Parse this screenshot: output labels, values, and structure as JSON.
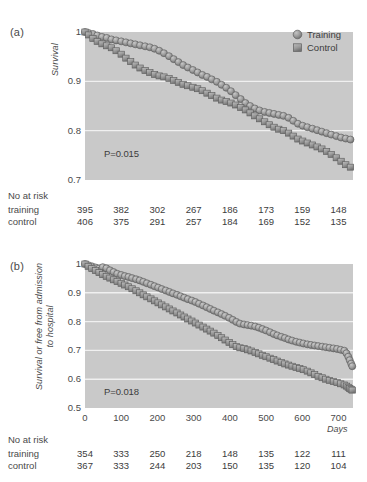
{
  "figure": {
    "background": "#ffffff",
    "plot_background": "#c9c9c9",
    "grid_color": "#f0f0f0",
    "marker_fill": "#9a9a9a",
    "marker_edge": "#5e5e5e",
    "line_color": "#7d7d7d"
  },
  "legend": {
    "items": [
      {
        "label": "Training",
        "marker": "circle"
      },
      {
        "label": "Control",
        "marker": "square"
      }
    ]
  },
  "panel_a": {
    "panel_label": "(a)",
    "pvalue": "P=0.015",
    "risk_title": "No at risk",
    "risk_rows": [
      {
        "label": "training",
        "values": [
          "395",
          "382",
          "302",
          "267",
          "186",
          "173",
          "159",
          "148"
        ]
      },
      {
        "label": "control",
        "values": [
          "406",
          "375",
          "291",
          "257",
          "184",
          "169",
          "152",
          "135"
        ]
      }
    ]
  },
  "panel_b": {
    "panel_label": "(b)",
    "pvalue": "P=0.018",
    "risk_title": "No at risk",
    "risk_rows": [
      {
        "label": "training",
        "values": [
          "354",
          "333",
          "250",
          "218",
          "148",
          "135",
          "122",
          "111"
        ]
      },
      {
        "label": "control",
        "values": [
          "367",
          "333",
          "244",
          "203",
          "150",
          "135",
          "120",
          "104"
        ]
      }
    ]
  },
  "footer": {
    "text": ""
  },
  "chart_data": [
    {
      "id": "panel_a",
      "type": "line",
      "title": "",
      "panel_label": "(a)",
      "xlabel": "",
      "ylabel": "Survival",
      "xlim": [
        0,
        740
      ],
      "ylim": [
        0.7,
        1.0
      ],
      "xticks": [
        0,
        100,
        200,
        300,
        400,
        500,
        600,
        700
      ],
      "xticklabels": [
        "",
        "",
        "",
        "",
        "",
        "",
        "",
        ""
      ],
      "yticks": [
        0.7,
        0.8,
        0.9,
        1.0
      ],
      "yticklabels": [
        "0.7",
        "0.8",
        "0.9",
        "1"
      ],
      "grid": "horizontal",
      "legend_position": "top-right",
      "annotations": [
        {
          "text": "P=0.015",
          "x": 60,
          "y": 0.735
        }
      ],
      "series": [
        {
          "name": "Training",
          "marker": "circle",
          "x": [
            0,
            10,
            22,
            34,
            47,
            60,
            73,
            86,
            100,
            113,
            126,
            139,
            152,
            166,
            179,
            192,
            205,
            218,
            232,
            245,
            258,
            271,
            284,
            298,
            311,
            324,
            337,
            350,
            364,
            377,
            390,
            403,
            416,
            430,
            443,
            456,
            469,
            482,
            496,
            509,
            522,
            535,
            548,
            562,
            575,
            588,
            601,
            614,
            628,
            641,
            654,
            667,
            680,
            694,
            707,
            720,
            733
          ],
          "y": [
            1.0,
            0.998,
            0.996,
            0.993,
            0.99,
            0.988,
            0.985,
            0.983,
            0.981,
            0.979,
            0.977,
            0.975,
            0.973,
            0.971,
            0.969,
            0.966,
            0.962,
            0.957,
            0.951,
            0.945,
            0.939,
            0.933,
            0.928,
            0.923,
            0.918,
            0.913,
            0.909,
            0.904,
            0.899,
            0.893,
            0.887,
            0.88,
            0.872,
            0.864,
            0.856,
            0.85,
            0.845,
            0.841,
            0.838,
            0.836,
            0.834,
            0.832,
            0.83,
            0.826,
            0.82,
            0.814,
            0.81,
            0.807,
            0.804,
            0.801,
            0.798,
            0.795,
            0.792,
            0.789,
            0.786,
            0.784,
            0.782
          ]
        },
        {
          "name": "Control",
          "marker": "square",
          "x": [
            0,
            10,
            22,
            34,
            47,
            60,
            73,
            86,
            100,
            113,
            126,
            139,
            152,
            166,
            179,
            192,
            205,
            218,
            232,
            245,
            258,
            271,
            284,
            298,
            311,
            324,
            337,
            350,
            364,
            377,
            390,
            403,
            416,
            430,
            443,
            456,
            469,
            482,
            496,
            509,
            522,
            535,
            548,
            562,
            575,
            588,
            601,
            614,
            628,
            641,
            654,
            667,
            680,
            694,
            707,
            720,
            733
          ],
          "y": [
            1.0,
            0.994,
            0.987,
            0.981,
            0.976,
            0.972,
            0.968,
            0.962,
            0.955,
            0.947,
            0.94,
            0.933,
            0.927,
            0.922,
            0.918,
            0.914,
            0.911,
            0.909,
            0.906,
            0.902,
            0.898,
            0.894,
            0.891,
            0.888,
            0.885,
            0.881,
            0.876,
            0.871,
            0.866,
            0.862,
            0.859,
            0.856,
            0.852,
            0.847,
            0.842,
            0.836,
            0.83,
            0.824,
            0.818,
            0.812,
            0.807,
            0.803,
            0.8,
            0.795,
            0.789,
            0.783,
            0.779,
            0.775,
            0.771,
            0.767,
            0.763,
            0.758,
            0.752,
            0.745,
            0.738,
            0.731,
            0.726
          ]
        }
      ]
    },
    {
      "id": "panel_b",
      "type": "line",
      "title": "",
      "panel_label": "(b)",
      "xlabel": "Days",
      "ylabel": "Survival or free from admission to hospital",
      "xlim": [
        0,
        740
      ],
      "ylim": [
        0.5,
        1.0
      ],
      "xticks": [
        0,
        100,
        200,
        300,
        400,
        500,
        600,
        700
      ],
      "xticklabels": [
        "0",
        "100",
        "200",
        "300",
        "400",
        "500",
        "600",
        "700"
      ],
      "yticks": [
        0.5,
        0.6,
        0.7,
        0.8,
        0.9,
        1.0
      ],
      "yticklabels": [
        "0.5",
        "0.6",
        "0.7",
        "0.8",
        "0.9",
        "1"
      ],
      "grid": "horizontal",
      "legend_position": "none",
      "annotations": [
        {
          "text": "P=0.018",
          "x": 60,
          "y": 0.545
        }
      ],
      "series": [
        {
          "name": "Training",
          "marker": "circle",
          "x": [
            0,
            9,
            19,
            29,
            39,
            49,
            59,
            69,
            79,
            89,
            100,
            110,
            120,
            130,
            141,
            151,
            161,
            171,
            182,
            192,
            202,
            212,
            223,
            233,
            243,
            254,
            264,
            274,
            284,
            295,
            305,
            315,
            326,
            336,
            346,
            356,
            367,
            377,
            387,
            398,
            408,
            418,
            428,
            439,
            449,
            459,
            470,
            480,
            490,
            500,
            511,
            521,
            531,
            542,
            552,
            562,
            572,
            583,
            593,
            603,
            614,
            624,
            634,
            644,
            655,
            665,
            675,
            686,
            696,
            706,
            716,
            722,
            727,
            731,
            735,
            738
          ],
          "y": [
            1.0,
            0.996,
            0.992,
            0.988,
            0.984,
            0.989,
            0.985,
            0.978,
            0.972,
            0.966,
            0.962,
            0.958,
            0.955,
            0.951,
            0.947,
            0.943,
            0.938,
            0.933,
            0.928,
            0.923,
            0.918,
            0.913,
            0.908,
            0.903,
            0.898,
            0.893,
            0.888,
            0.883,
            0.878,
            0.873,
            0.868,
            0.862,
            0.856,
            0.85,
            0.844,
            0.838,
            0.832,
            0.826,
            0.82,
            0.813,
            0.806,
            0.799,
            0.793,
            0.79,
            0.788,
            0.786,
            0.783,
            0.779,
            0.774,
            0.769,
            0.763,
            0.757,
            0.752,
            0.747,
            0.743,
            0.738,
            0.734,
            0.73,
            0.727,
            0.724,
            0.721,
            0.719,
            0.717,
            0.715,
            0.713,
            0.711,
            0.709,
            0.707,
            0.705,
            0.702,
            0.699,
            0.69,
            0.678,
            0.666,
            0.654,
            0.645
          ]
        },
        {
          "name": "Control",
          "marker": "square",
          "x": [
            0,
            9,
            19,
            29,
            39,
            49,
            59,
            69,
            79,
            89,
            100,
            110,
            120,
            130,
            141,
            151,
            161,
            171,
            182,
            192,
            202,
            212,
            223,
            233,
            243,
            254,
            264,
            274,
            284,
            295,
            305,
            315,
            326,
            336,
            346,
            356,
            367,
            377,
            387,
            398,
            408,
            418,
            428,
            439,
            449,
            459,
            470,
            480,
            490,
            500,
            511,
            521,
            531,
            542,
            552,
            562,
            572,
            583,
            593,
            603,
            614,
            624,
            634,
            644,
            655,
            665,
            675,
            686,
            696,
            706,
            716,
            722,
            727,
            731,
            735,
            738
          ],
          "y": [
            1.0,
            0.992,
            0.984,
            0.977,
            0.97,
            0.963,
            0.957,
            0.951,
            0.945,
            0.939,
            0.933,
            0.927,
            0.921,
            0.914,
            0.907,
            0.9,
            0.893,
            0.886,
            0.879,
            0.872,
            0.865,
            0.858,
            0.851,
            0.844,
            0.837,
            0.83,
            0.823,
            0.816,
            0.809,
            0.802,
            0.795,
            0.788,
            0.781,
            0.774,
            0.767,
            0.76,
            0.752,
            0.744,
            0.736,
            0.728,
            0.72,
            0.713,
            0.709,
            0.706,
            0.702,
            0.698,
            0.693,
            0.688,
            0.683,
            0.678,
            0.673,
            0.668,
            0.663,
            0.658,
            0.653,
            0.649,
            0.645,
            0.641,
            0.637,
            0.633,
            0.628,
            0.622,
            0.616,
            0.61,
            0.605,
            0.6,
            0.596,
            0.592,
            0.588,
            0.584,
            0.58,
            0.576,
            0.572,
            0.568,
            0.565,
            0.562
          ]
        }
      ]
    }
  ]
}
